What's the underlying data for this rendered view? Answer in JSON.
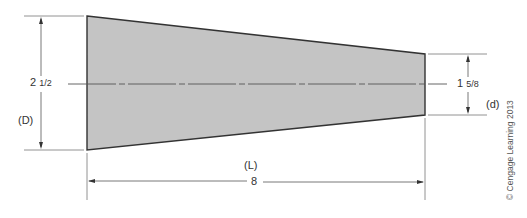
{
  "diagram": {
    "type": "tapered-shaft-dimension-drawing",
    "colors": {
      "fill": "#c4c4c4",
      "outline": "#333333",
      "dimension_line": "#555555",
      "text": "#333333"
    },
    "dimensions": {
      "large_diameter": {
        "whole": "2",
        "fraction": "1/2",
        "symbol": "(D)"
      },
      "small_diameter": {
        "whole": "1",
        "fraction": "5/8",
        "symbol": "(d)"
      },
      "length": {
        "value": "8",
        "symbol": "(L)"
      }
    },
    "copyright": "© Cengage Learning 2013"
  }
}
